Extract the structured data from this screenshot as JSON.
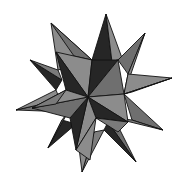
{
  "figure": {
    "colors": {
      "light_face": "#8c8c8c",
      "mid_face": "#6f6f6f",
      "dark_face": "#262626",
      "edge": "#111111",
      "background": "#ffffff"
    }
  },
  "caption": {
    "text": "",
    "note": "caption text cut off at bottom edge, illegible"
  }
}
